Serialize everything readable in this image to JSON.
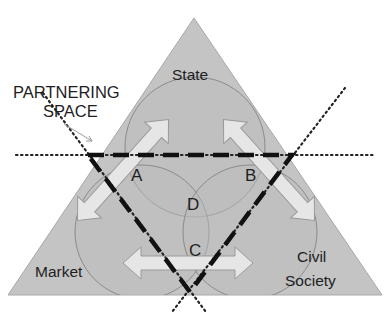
{
  "diagram": {
    "title": "Partnering Space",
    "colors": {
      "triangle_fill": "#c4c4c4",
      "circle_fill": "#bdbdbd",
      "circle_stroke": "#8a8a8a",
      "arrow_fill": "#e6e6e6",
      "arrow_stroke": "#9a9a9a",
      "dash_color": "#111111",
      "text_color": "#1e1e1e"
    },
    "labels": {
      "partnering_line1": "PARTNERING",
      "partnering_line2": "SPACE",
      "state": "State",
      "market": "Market",
      "civil_line1": "Civil",
      "civil_line2": "Society",
      "a": "A",
      "b": "B",
      "c": "C",
      "d": "D"
    },
    "sectors": [
      {
        "name": "State",
        "position": "top"
      },
      {
        "name": "Market",
        "position": "bottom-left"
      },
      {
        "name": "Civil Society",
        "position": "bottom-right"
      }
    ],
    "overlap_regions": [
      {
        "id": "A",
        "between": [
          "State",
          "Market"
        ]
      },
      {
        "id": "B",
        "between": [
          "State",
          "Civil Society"
        ]
      },
      {
        "id": "C",
        "between": [
          "Market",
          "Civil Society"
        ]
      },
      {
        "id": "D",
        "between": [
          "State",
          "Market",
          "Civil Society"
        ]
      }
    ]
  }
}
